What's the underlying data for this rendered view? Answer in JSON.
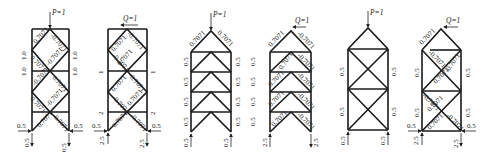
{
  "figure": {
    "diagrams": [
      {
        "id": "d1",
        "load_label": "P=1",
        "member_labels": [
          "0.7071",
          "-0.7071",
          "0.7071",
          "-0.7071",
          "-0.7071",
          "0.7071",
          "0.7071",
          "-0.7071",
          "0.7071",
          "-0.7071"
        ],
        "side_labels_left": [
          "1.0",
          "1.0"
        ],
        "side_labels_right": [
          "1.0",
          "1.0"
        ],
        "reactions": {
          "left_h": "0.5",
          "left_v": "0.5",
          "right_h": "0.5",
          "right_v": "0.5"
        }
      },
      {
        "id": "d2",
        "load_label": "Q=1",
        "member_labels": [
          "-0.7071",
          "0.7071",
          "0.7071",
          "-0.7071",
          "-0.7071",
          "0.7071",
          "0.7071",
          "-0.7071",
          "0.7071",
          "-0.7071"
        ],
        "side_labels_left": [
          "1",
          "2"
        ],
        "side_labels_right": [
          "1",
          "2"
        ],
        "reactions": {
          "left_h": "0.5",
          "left_v": "2.5",
          "right_h": "0.5",
          "right_v": "2.5"
        }
      },
      {
        "id": "d3",
        "load_label": "P=1",
        "member_labels": [
          "0.7071",
          "0.7071"
        ],
        "side_labels_left": [
          "0.5",
          "0.5",
          "0.5",
          "0.5"
        ],
        "side_labels_right": [
          "0.5",
          "0.5",
          "0.5",
          "0.5"
        ],
        "reactions": {
          "left_v": "0.5",
          "right_v": "0.5"
        }
      },
      {
        "id": "d4",
        "load_label": "Q=1",
        "member_labels": [
          "0.7071",
          "-0.7071",
          "0.7071",
          "-0.7071",
          "0.7071",
          "-0.7071",
          "0.7071",
          "-0.7071",
          "0.7071",
          "-0.7071"
        ],
        "side_labels_left": [
          "0.5",
          "0.5",
          "0.5",
          "0.5"
        ],
        "reactions": {
          "left_v": "2.5",
          "right_v": "2.5"
        }
      },
      {
        "id": "d5",
        "load_label": "P=1",
        "side_labels_left": [
          "0.5",
          "0.5"
        ],
        "side_labels_right": [
          "0.5",
          "0.5"
        ],
        "reactions": {
          "left_v": "0.5",
          "right_v": "0.5"
        }
      },
      {
        "id": "d6",
        "load_label": "Q=1",
        "member_labels": [
          "0.7071",
          "-0.7071",
          "0.7071",
          "-0.7071",
          "0.7071",
          "-0.7071",
          "0.7071",
          "-0.7071"
        ],
        "side_labels_left": [
          "0.5",
          "0.5"
        ],
        "side_labels_right": [
          "0.5",
          "0.5"
        ],
        "reactions": {
          "left_h": "0.5",
          "left_v": "2.5",
          "right_h": "0.5",
          "right_v": "2.5"
        }
      }
    ]
  }
}
